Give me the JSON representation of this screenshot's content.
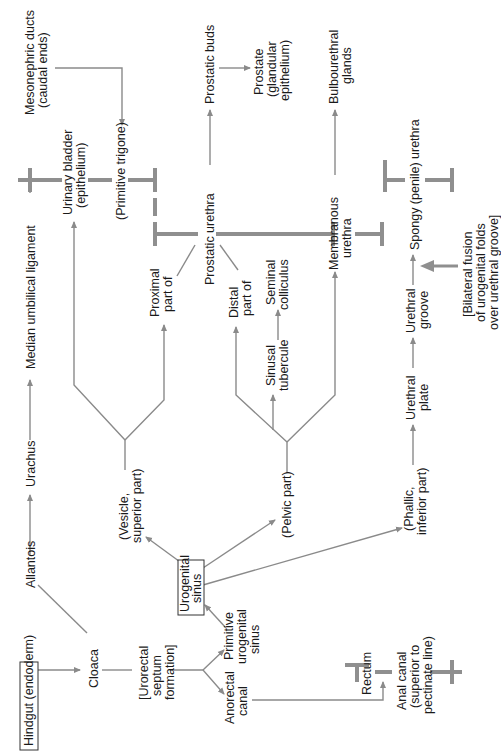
{
  "diagram": {
    "orientation": "rotated-90-ccw",
    "colors": {
      "line": "#8a8a8a",
      "text": "#1a1a1a",
      "box_border": "#333333",
      "background": "#ffffff"
    },
    "nodes": {
      "hindgut": "Hindgut (endoderm)",
      "allantois": "Allantois",
      "cloaca": "Cloaca",
      "urorectal_1": "[Urorectal",
      "urorectal_2": "septum",
      "urorectal_3": "formation]",
      "anorectal_1": "Anorectal",
      "anorectal_2": "canal",
      "primitive_ug_1": "Primitive",
      "primitive_ug_2": "urogenital",
      "primitive_ug_3": "sinus",
      "ug_sinus_1": "Urogenital",
      "ug_sinus_2": "sinus",
      "rectum": "Rectum",
      "anal_canal_1": "Anal canal",
      "anal_canal_2": "(superior to",
      "anal_canal_3": "pectinate line)",
      "urachus": "Urachus",
      "median_umbilical": "Median umbilical ligament",
      "vesicle_1": "(Vesicle,",
      "vesicle_2": "superior part)",
      "pelvic": "(Pelvic part)",
      "phallic_1": "(Phallic,",
      "phallic_2": "inferior part)",
      "urinary_bladder_1": "Urinary bladder",
      "urinary_bladder_2": "(epithelium)",
      "primitive_trigone": "(Primitive trigone)",
      "mesonephric_1": "Mesonephric ducts",
      "mesonephric_2": "(caudal ends)",
      "proximal_1": "Proximal",
      "proximal_2": "part of",
      "distal_1": "Distal",
      "distal_2": "part of",
      "prostatic_urethra": "Prostatic urethra",
      "prostatic_buds": "Prostatic buds",
      "prostate_1": "Prostate",
      "prostate_2": "(glandular",
      "prostate_3": "epithelium)",
      "sinusal_1": "Sinusal",
      "sinusal_2": "tubercule",
      "seminal_1": "Seminal",
      "seminal_2": "colliculus",
      "membranous_1": "Membranous",
      "membranous_2": "urethra",
      "bulbourethral_1": "Bulbourethral",
      "bulbourethral_2": "glands",
      "urethral_plate_1": "Urethral",
      "urethral_plate_2": "plate",
      "urethral_groove_1": "Urethral",
      "urethral_groove_2": "groove",
      "spongy": "Spongy (penile) urethra",
      "bilateral_1": "[Bilateral fusion",
      "bilateral_2": "of urogenital folds",
      "bilateral_3": "over urethral groove]"
    }
  }
}
